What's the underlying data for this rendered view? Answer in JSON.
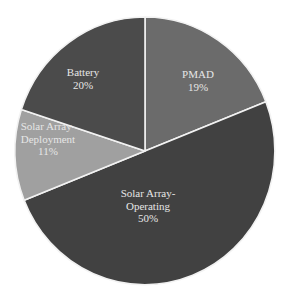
{
  "chart_data": {
    "type": "pie",
    "title": "",
    "start_angle_deg": 0,
    "direction": "clockwise",
    "slices": [
      {
        "label": "PMAD",
        "label_lines": [
          "PMAD",
          "19%"
        ],
        "value": 19,
        "color": "#6b6b6b",
        "label_pos": [
          198,
          78
        ]
      },
      {
        "label": "Solar Array-Operating",
        "label_lines": [
          "Solar Array-",
          "Operating",
          "50%"
        ],
        "value": 50,
        "color": "#414141",
        "label_pos": [
          148,
          197
        ]
      },
      {
        "label": "Solar Array-Deployment",
        "label_lines": [
          "Solar Array-",
          "Deployment",
          "11%"
        ],
        "value": 11,
        "color": "#a0a0a0",
        "label_pos": [
          48,
          130
        ]
      },
      {
        "label": "Battery",
        "label_lines": [
          "Battery",
          "20%"
        ],
        "value": 20,
        "color": "#4b4b4b",
        "label_pos": [
          83,
          76
        ]
      }
    ],
    "categories": [
      "PMAD",
      "Solar Array-Operating",
      "Solar Array-Deployment",
      "Battery"
    ],
    "values": [
      19,
      50,
      11,
      20
    ],
    "units": "%",
    "legend": "none (labels inside slices)"
  }
}
